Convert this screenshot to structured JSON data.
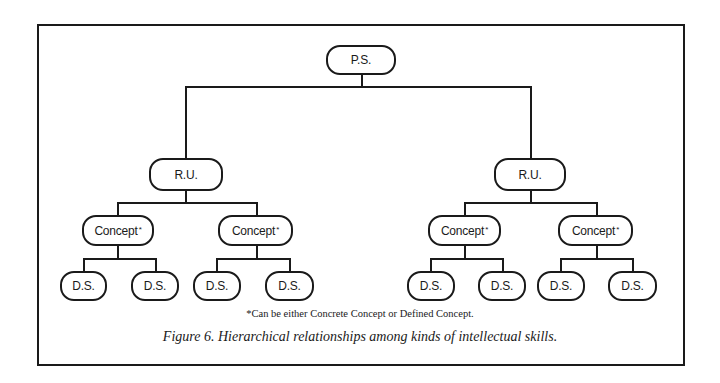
{
  "diagram": {
    "root": {
      "label": "P.S."
    },
    "level1": [
      {
        "label": "R.U."
      },
      {
        "label": "R.U."
      }
    ],
    "level2": [
      {
        "label": "Concept",
        "mark": "*"
      },
      {
        "label": "Concept",
        "mark": "*"
      },
      {
        "label": "Concept",
        "mark": "*"
      },
      {
        "label": "Concept",
        "mark": "*"
      }
    ],
    "level3": [
      {
        "label": "D.S."
      },
      {
        "label": "D.S."
      },
      {
        "label": "D.S."
      },
      {
        "label": "D.S."
      },
      {
        "label": "D.S."
      },
      {
        "label": "D.S."
      },
      {
        "label": "D.S."
      },
      {
        "label": "D.S."
      }
    ],
    "footnote": "*Can be either Concrete Concept or Defined Concept.",
    "caption": "Figure 6.  Hierarchical relationships among kinds of intellectual skills."
  },
  "colors": {
    "line": "#1a1a1a",
    "background": "#ffffff"
  }
}
